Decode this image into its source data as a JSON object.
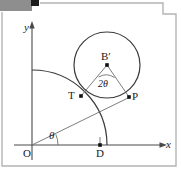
{
  "figure": {
    "type": "geometry-diagram",
    "width": 181,
    "height": 169,
    "background_color": "#ffffff",
    "stroke_color": "#3a3a3a",
    "label_color": "#1a1a1a",
    "decor": {
      "gray_bar_color": "#8e8e8e",
      "black_square_color": "#1c1c1c",
      "frame_color": "#b4b4b4"
    },
    "axes": {
      "x_label": "x",
      "y_label": "y",
      "origin_label": "O",
      "x_axis_y": 145,
      "y_axis_x": 32,
      "x_arrow_tip_x": 167,
      "y_arrow_tip_y": 22
    },
    "points": [
      {
        "name": "O",
        "label": "O",
        "x": 32,
        "y": 145,
        "dot": false
      },
      {
        "name": "D",
        "label": "D",
        "x": 100,
        "y": 145,
        "dot": true
      },
      {
        "name": "T",
        "label": "T",
        "x": 81,
        "y": 96,
        "dot": true
      },
      {
        "name": "P",
        "label": "P",
        "x": 129,
        "y": 97,
        "dot": true
      },
      {
        "name": "B",
        "label": "B′",
        "x": 107,
        "y": 65,
        "dot": true
      }
    ],
    "angles": [
      {
        "name": "theta-at-origin",
        "label": "θ",
        "vertex": "O",
        "x": 51,
        "y": 136
      },
      {
        "name": "two-theta-at-B",
        "label": "2θ",
        "vertex": "B′",
        "x": 101,
        "y": 84
      }
    ],
    "circle": {
      "center_x": 107,
      "center_y": 65,
      "radius": 33
    },
    "arc": {
      "center_x": 32,
      "center_y": 145,
      "radius": 75,
      "from_deg": 90,
      "to_deg": 0
    },
    "segments": [
      {
        "name": "ray-O-to-P",
        "from": "O",
        "to": "P"
      },
      {
        "name": "chord-B-to-T",
        "from": "B′",
        "to": "T"
      },
      {
        "name": "chord-B-to-P",
        "from": "B′",
        "to": "P"
      }
    ]
  }
}
